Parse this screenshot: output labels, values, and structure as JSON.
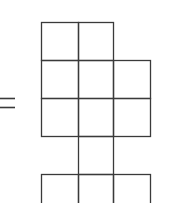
{
  "diagram": {
    "type": "grid-figure",
    "symbol": "=",
    "line_color": "#3a3a3a",
    "background": "#ffffff",
    "cell_size": 36.5,
    "origin": {
      "x": 41,
      "y": 22
    },
    "rows": [
      {
        "row": 0,
        "cells": [
          0,
          1
        ]
      },
      {
        "row": 1,
        "cells": [
          0,
          1,
          2
        ]
      },
      {
        "row": 2,
        "cells": [
          0,
          1,
          2
        ]
      },
      {
        "row": 3,
        "cells": [
          1
        ]
      },
      {
        "row": 4,
        "cells": [
          0,
          1,
          2
        ]
      }
    ]
  }
}
